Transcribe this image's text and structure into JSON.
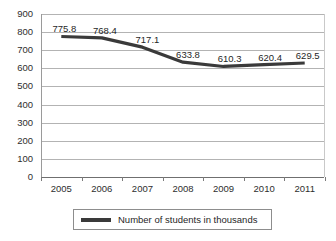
{
  "chart_data": {
    "type": "line",
    "title": "",
    "xlabel": "",
    "ylabel": "",
    "categories": [
      "2005",
      "2006",
      "2007",
      "2008",
      "2009",
      "2010",
      "2011"
    ],
    "series": [
      {
        "name": "Number of students in thousands",
        "color": "#3a3a3a",
        "values": [
          775.8,
          768.4,
          717.1,
          633.8,
          610.3,
          620.4,
          629.5
        ]
      }
    ],
    "point_labels": [
      "775.8",
      "768.4",
      "717.1",
      "633.8",
      "610.3",
      "620.4",
      "629.5"
    ],
    "ylim": [
      0,
      900
    ],
    "ytick_step": 100,
    "ytick_labels": [
      "900",
      "800",
      "700",
      "600",
      "500",
      "400",
      "300",
      "200",
      "100",
      "0"
    ],
    "grid": true,
    "legend_position": "bottom"
  },
  "legend": {
    "entries": [
      {
        "label": "Number of students in thousands",
        "color": "#3a3a3a"
      }
    ]
  },
  "colors": {
    "series_line": "#3a3a3a",
    "gridline": "#b3b3b3",
    "axis": "#6f6f6f",
    "text": "#2e2e2e",
    "background": "#ffffff"
  }
}
